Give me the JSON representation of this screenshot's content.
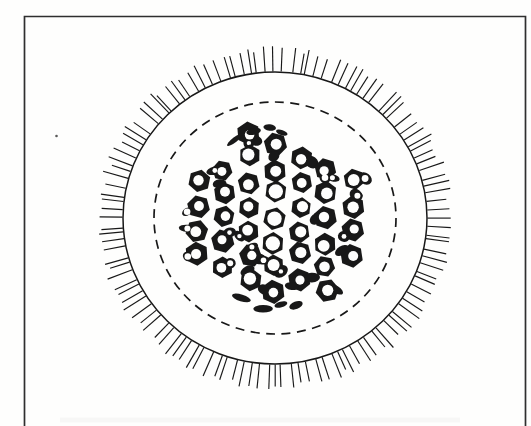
{
  "figure": {
    "canvas": {
      "width": 531,
      "height": 426
    },
    "colors": {
      "paper": "#fefefd",
      "ink": "#181818",
      "frame": "#2f2f2f",
      "speck": "#5a5a5a",
      "bleed": "#8a8a8a"
    },
    "frame": {
      "left": 24.5,
      "top": 16.5,
      "right": 525.5,
      "stroke_width": 1.7
    },
    "center": {
      "x": 275,
      "y": 218
    },
    "outer_circle": {
      "rx": 152,
      "ry": 146,
      "stroke_width": 1.5
    },
    "ticks": {
      "count": 120,
      "length_min": 20,
      "length_max": 27,
      "stroke_width": 1.15,
      "angle_jitter_deg": 1.1
    },
    "dashed_circle": {
      "rx": 121,
      "ry": 116,
      "stroke_width": 1.7,
      "dash": "9 6.5"
    },
    "bundle": {
      "radius": 89,
      "col_spacing": 25.8,
      "row_spacing": 24.4,
      "pos_jitter": 2.2,
      "hex_radius_min": 10.4,
      "hex_radius_max": 12.2,
      "light_core_radius": 27,
      "hole_radius_light": 7.2,
      "hole_radius_heavy_min": 4.4,
      "hole_radius_heavy_max": 6.2,
      "blob_chance_base": 0.25,
      "blob_chance_scale": 0.65,
      "double_hole_chance": 0.45,
      "rim_dash_count": 8
    },
    "speck": {
      "x": 56.5,
      "y": 136,
      "r": 1.3
    },
    "bleed_band": {
      "x": 60,
      "y": 417.5,
      "width": 400,
      "height": 5,
      "opacity": 0.06
    },
    "seed": 11
  }
}
